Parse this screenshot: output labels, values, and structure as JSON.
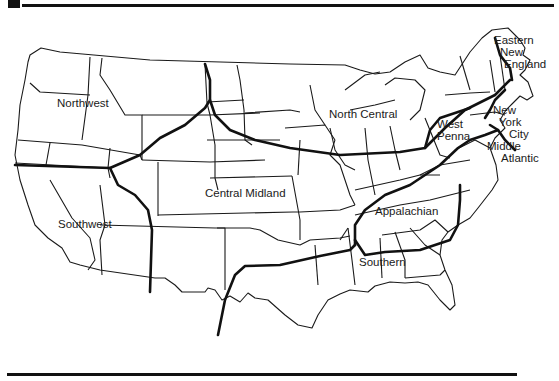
{
  "map": {
    "title": "",
    "colors": {
      "ink": "#111111",
      "background": "#ffffff"
    },
    "regions": [
      {
        "id": "northwest",
        "label": "Northwest"
      },
      {
        "id": "southwest",
        "label": "Southwest"
      },
      {
        "id": "central-midland",
        "label": "Central Midland"
      },
      {
        "id": "north-central",
        "label": "North Central"
      },
      {
        "id": "appalachian",
        "label": "Appalachian"
      },
      {
        "id": "southern",
        "label": "Southern"
      },
      {
        "id": "west-penna",
        "label_line1": "West",
        "label_line2": "Penna."
      },
      {
        "id": "middle-atlantic",
        "label_line1": "Middle",
        "label_line2": "Atlantic"
      },
      {
        "id": "new-york-city",
        "label_line1": "New",
        "label_line2": "York",
        "label_line3": "City"
      },
      {
        "id": "eastern-new-england",
        "label_line1": "Eastern",
        "label_line2": "New",
        "label_line3": "England"
      }
    ]
  }
}
